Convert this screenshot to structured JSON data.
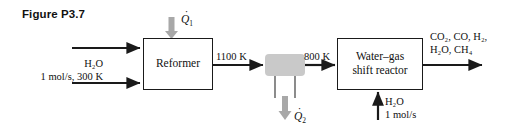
{
  "figure": {
    "caption": "Figure P3.7"
  },
  "units": {
    "reformer": {
      "label": "Reformer"
    },
    "heat_exchanger": {
      "label": "",
      "symbol": "zigzag"
    },
    "wgs_reactor": {
      "line1": "Water–gas",
      "line2": "shift reactor"
    }
  },
  "streams": {
    "feed_top": {
      "label": ""
    },
    "feed_water_line1": "H₂O",
    "feed_water_line2": "1 mol/s, 300 K",
    "reformer_outlet_temp": "1100 K",
    "hx_outlet_temp": "800 K",
    "wgs_water_line1": "H₂O",
    "wgs_water_line2": "1 mol/s",
    "product_line1": "CO₂, CO, H₂,",
    "product_line2": "H₂O, CH₄"
  },
  "heat": {
    "q1_symbol": "Q",
    "q1_subscript": "1",
    "q2_symbol": "Q",
    "q2_subscript": "2"
  },
  "colors": {
    "line": "#1a1a1a",
    "heat_arrow": "#a8a8a8",
    "exchanger_fill": "#c9c9c9",
    "background": "#ffffff"
  }
}
